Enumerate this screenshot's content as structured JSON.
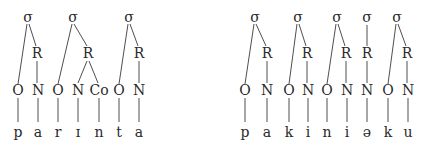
{
  "diagrams": [
    {
      "name": "parinta",
      "segments": [
        "p",
        "a",
        "r",
        "ɪ",
        "n",
        "t",
        "a"
      ],
      "syllables": [
        {
          "label": "σ",
          "rime": "R",
          "constituents": [
            "O",
            "N"
          ]
        },
        {
          "label": "σ",
          "rime": "R",
          "constituents": [
            "O",
            "N",
            "Co"
          ]
        },
        {
          "label": "σ",
          "rime": "R",
          "constituents": [
            "O",
            "N"
          ]
        }
      ]
    },
    {
      "name": "pakiniəku",
      "segments": [
        "p",
        "a",
        "k",
        "i",
        "n",
        "i",
        "ə",
        "k",
        "u"
      ],
      "syllables": [
        {
          "label": "σ",
          "rime": "R",
          "constituents": [
            "O",
            "N"
          ]
        },
        {
          "label": "σ",
          "rime": "R",
          "constituents": [
            "O",
            "N"
          ]
        },
        {
          "label": "σ",
          "rime": "R",
          "constituents": [
            "O",
            "N"
          ]
        },
        {
          "label": "σ",
          "rime": "R",
          "constituents": [
            "N"
          ]
        },
        {
          "label": "σ",
          "rime": "R",
          "constituents": [
            "O",
            "N"
          ]
        }
      ]
    }
  ],
  "labels": {
    "sigma": "σ",
    "rime": "R",
    "onset": "O",
    "nucleus": "N",
    "coda": "Co"
  }
}
